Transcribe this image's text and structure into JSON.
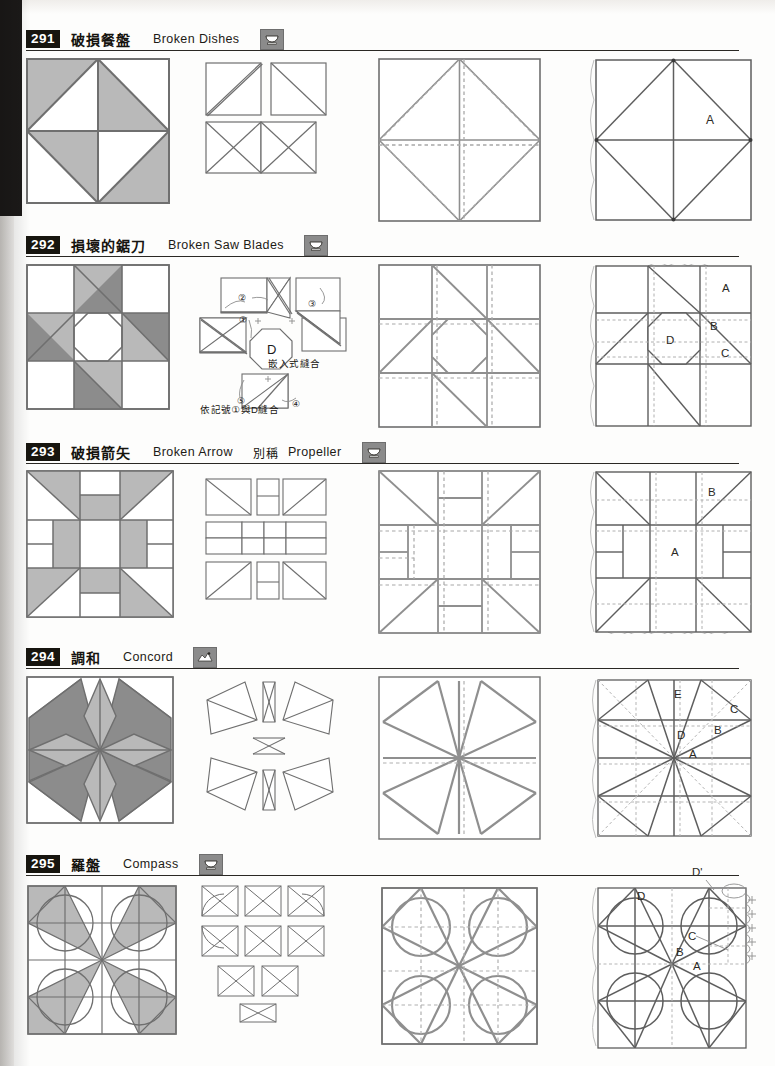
{
  "page": {
    "kind": "quilt-block-pattern-reference",
    "width": 775,
    "height": 1066,
    "colors": {
      "ink": "#2a2824",
      "light_gray_fabric": "#b9b9b9",
      "dark_gray_fabric": "#8c8c8c",
      "white_fabric": "#ffffff",
      "seam_line": "#6f6f6f",
      "dashed_line": "#9a9a9a",
      "badge_bg": "#17150f",
      "icon_bg": "#8b8b8b"
    },
    "column_headings": [
      "colored block",
      "piecing units",
      "construction with seam lines",
      "template with letters"
    ]
  },
  "entries": [
    {
      "number": "291",
      "name_cn": "破損餐盤",
      "name_en": "Broken Dishes",
      "alias_label": "",
      "alias_en": "",
      "icon": "cup-icon",
      "template_labels": [
        "A"
      ],
      "annotations": []
    },
    {
      "number": "292",
      "name_cn": "損壞的鋸刀",
      "name_en": "Broken Saw Blades",
      "alias_label": "",
      "alias_en": "",
      "icon": "cup-icon",
      "template_labels": [
        "A",
        "B",
        "C",
        "D"
      ],
      "annotations": [
        {
          "text": "嵌入式縫合",
          "note": "inset seam"
        },
        {
          "text": "依記號①與D縫合",
          "note": "sew to D following mark 1"
        },
        {
          "text": "D",
          "note": "center octagon piece"
        },
        {
          "text": "①",
          "note": "order mark 1"
        },
        {
          "text": "②",
          "note": "order mark 2"
        },
        {
          "text": "③",
          "note": "order mark 3"
        },
        {
          "text": "④",
          "note": "order mark 4"
        },
        {
          "text": "⑤",
          "note": "order mark 5"
        }
      ]
    },
    {
      "number": "293",
      "name_cn": "破損箭矢",
      "name_en": "Broken Arrow",
      "alias_label": "別稱",
      "alias_en": "Propeller",
      "icon": "cup-icon",
      "template_labels": [
        "A",
        "B"
      ],
      "annotations": []
    },
    {
      "number": "294",
      "name_cn": "調和",
      "name_en": "Concord",
      "alias_label": "",
      "alias_en": "",
      "icon": "landscape-icon",
      "template_labels": [
        "A",
        "B",
        "C",
        "D",
        "E"
      ],
      "annotations": []
    },
    {
      "number": "295",
      "name_cn": "羅盤",
      "name_en": "Compass",
      "alias_label": "",
      "alias_en": "",
      "icon": "cup-icon",
      "template_labels": [
        "A",
        "B",
        "C",
        "D",
        "D'"
      ],
      "annotations": []
    }
  ]
}
